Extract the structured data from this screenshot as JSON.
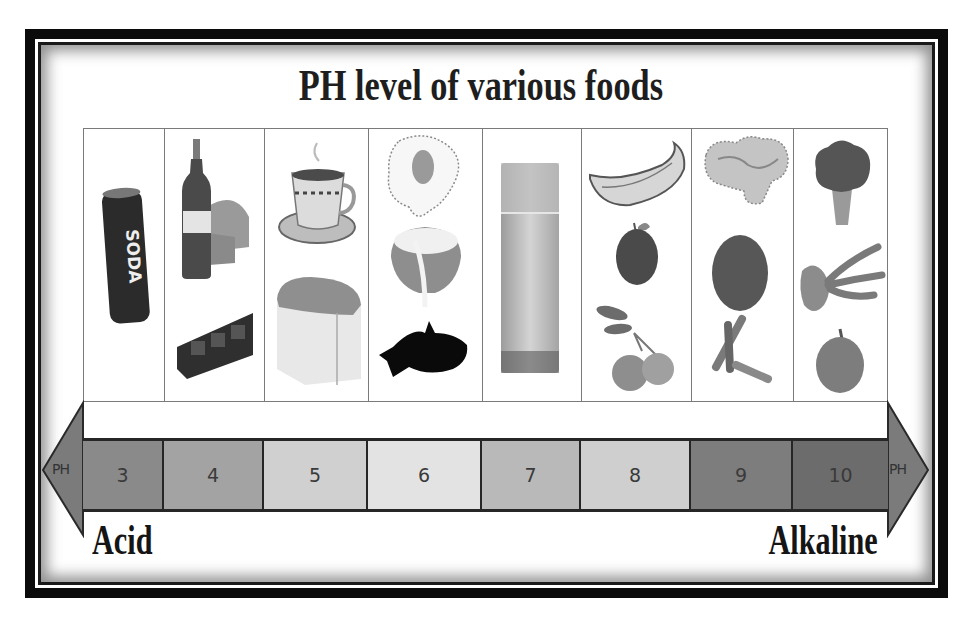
{
  "title": "PH level of various foods",
  "scale": {
    "left_end_label": "Acid",
    "right_end_label": "Alkaline",
    "left_arrow_text": "PH",
    "right_arrow_text": "PH",
    "segments": [
      {
        "value": "3",
        "color": "#8a8a8a"
      },
      {
        "value": "4",
        "color": "#a3a3a3"
      },
      {
        "value": "5",
        "color": "#d0d0d0"
      },
      {
        "value": "6",
        "color": "#e3e3e3"
      },
      {
        "value": "7",
        "color": "#b9b9b9"
      },
      {
        "value": "8",
        "color": "#cfcfcf"
      },
      {
        "value": "9",
        "color": "#7d7d7d"
      },
      {
        "value": "10",
        "color": "#6c6c6c"
      }
    ],
    "arrow_color": "#7b7b7b"
  },
  "food_columns": [
    {
      "ph": "3",
      "foods": [
        "soda-can"
      ]
    },
    {
      "ph": "4",
      "foods": [
        "wine-bottle",
        "cheese-wedge",
        "candy-tray"
      ]
    },
    {
      "ph": "5",
      "foods": [
        "coffee-cup",
        "bread-loaf"
      ]
    },
    {
      "ph": "6",
      "foods": [
        "fried-egg",
        "coconut-milk",
        "fish"
      ]
    },
    {
      "ph": "7",
      "foods": [
        "glass-of-milk"
      ]
    },
    {
      "ph": "8",
      "foods": [
        "banana",
        "apple",
        "oranges"
      ]
    },
    {
      "ph": "9",
      "foods": [
        "ginger-root",
        "melon",
        "cinnamon-sticks"
      ]
    },
    {
      "ph": "10",
      "foods": [
        "broccoli",
        "seaweed",
        "onion"
      ]
    }
  ]
}
